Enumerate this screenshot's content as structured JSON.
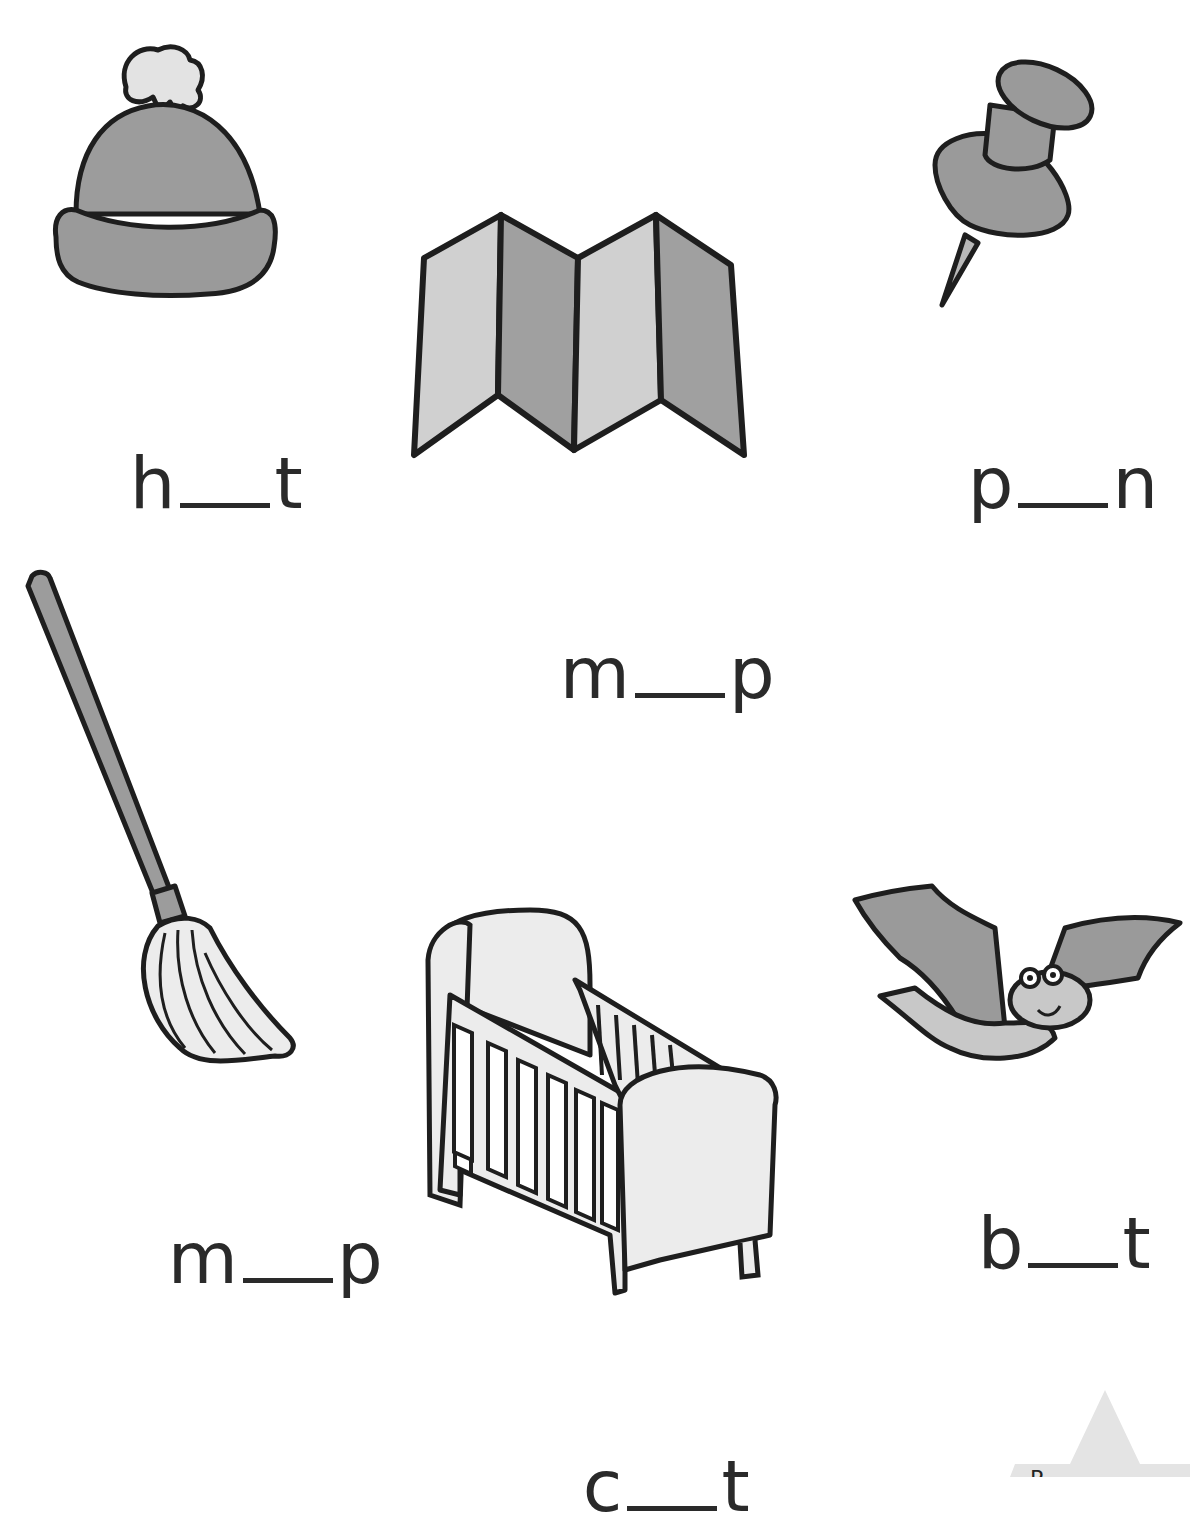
{
  "worksheet": {
    "items": [
      {
        "picture": "woolly-hat",
        "first": "h",
        "last": "t"
      },
      {
        "picture": "folded-map",
        "first": "m",
        "last": "p"
      },
      {
        "picture": "push-pin",
        "first": "p",
        "last": "n"
      },
      {
        "picture": "mop",
        "first": "m",
        "last": "p"
      },
      {
        "picture": "cot",
        "first": "c",
        "last": "t"
      },
      {
        "picture": "bat",
        "first": "b",
        "last": "t"
      }
    ],
    "corner_badge": {
      "label": "Pre...",
      "visible_text": "P"
    }
  },
  "colors": {
    "outline": "#1e1e1e",
    "dark_grey": "#8f8f8f",
    "mid_grey": "#a9a9a9",
    "light_grey": "#d6d6d6",
    "very_light": "#ececec",
    "text": "#2a2a2a"
  }
}
